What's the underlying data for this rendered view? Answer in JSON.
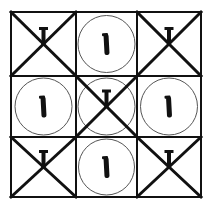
{
  "puzzle": {
    "grid": {
      "rows": 3,
      "cols": 3,
      "x_lines": [
        11,
        76,
        137,
        201
      ],
      "y_lines": [
        12,
        76,
        137,
        197
      ],
      "line_color": "#111111",
      "background": "#ffffff"
    },
    "cells": [
      {
        "row": 0,
        "col": 0,
        "x_mark": true,
        "circle": false,
        "nail": "peg-with-crossbar"
      },
      {
        "row": 0,
        "col": 1,
        "x_mark": false,
        "circle": true,
        "nail": "bold-peg"
      },
      {
        "row": 0,
        "col": 2,
        "x_mark": true,
        "circle": false,
        "nail": "peg-with-crossbar"
      },
      {
        "row": 1,
        "col": 0,
        "x_mark": false,
        "circle": true,
        "nail": "bold-peg"
      },
      {
        "row": 1,
        "col": 1,
        "x_mark": true,
        "circle": true,
        "nail": "peg-with-crossbar"
      },
      {
        "row": 1,
        "col": 2,
        "x_mark": false,
        "circle": true,
        "nail": "bold-peg"
      },
      {
        "row": 2,
        "col": 0,
        "x_mark": true,
        "circle": false,
        "nail": "peg-with-crossbar"
      },
      {
        "row": 2,
        "col": 1,
        "x_mark": false,
        "circle": true,
        "nail": "bold-peg"
      },
      {
        "row": 2,
        "col": 2,
        "x_mark": true,
        "circle": false,
        "nail": "peg-with-crossbar"
      }
    ],
    "colors": {
      "stroke": "#111111",
      "circle_stroke": "#555555"
    }
  }
}
